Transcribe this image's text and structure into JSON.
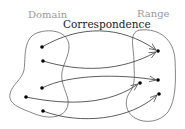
{
  "labels": {
    "domain": "Domain",
    "range": "Range",
    "title": "Correspondence"
  },
  "colors": {
    "label_gray": "#9a9a9a",
    "title": "#222222",
    "outline": "#666666",
    "arrow": "#333333",
    "point": "#000000"
  },
  "domain_points": [
    {
      "x": 42,
      "y": 47
    },
    {
      "x": 43,
      "y": 61
    },
    {
      "x": 42,
      "y": 88
    },
    {
      "x": 26,
      "y": 97
    },
    {
      "x": 43,
      "y": 111
    }
  ],
  "range_points": [
    {
      "x": 158,
      "y": 51
    },
    {
      "x": 158,
      "y": 80
    },
    {
      "x": 140,
      "y": 83
    },
    {
      "x": 159,
      "y": 94
    }
  ]
}
